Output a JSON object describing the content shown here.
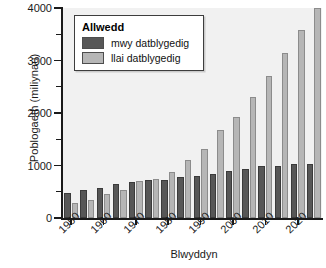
{
  "chart_data": {
    "type": "bar",
    "title": "",
    "xlabel": "Blwyddyn",
    "ylabel": "Poblogaeth (miliynau)",
    "ylim": [
      0,
      4000
    ],
    "yticks": [
      0,
      1000,
      2000,
      3000,
      4000
    ],
    "ytick_labels": [
      "0",
      "1000",
      "2000",
      "3000",
      "4000"
    ],
    "yticks_minor": [
      500,
      1500,
      2500,
      3500
    ],
    "grid": false,
    "legend": {
      "title": "Allwedd",
      "position": "upper-left-inside",
      "entries": [
        {
          "label": "mwy datblygedig",
          "color": "#575757"
        },
        {
          "label": "llai datblygedig",
          "color": "#b6b6b6"
        }
      ]
    },
    "x": [
      1950,
      1955,
      1960,
      1965,
      1970,
      1975,
      1980,
      1985,
      1990,
      1995,
      2000,
      2005,
      2010,
      2015,
      2020,
      2025
    ],
    "xtick_labels": [
      "1950",
      "1960",
      "1970",
      "1980",
      "1990",
      "2000",
      "2010",
      "2020"
    ],
    "xtick_values": [
      1950,
      1960,
      1970,
      1980,
      1990,
      2000,
      2010,
      2020
    ],
    "series": [
      {
        "name": "mwy datblygedig",
        "color": "#575757",
        "values": [
          470,
          540,
          580,
          640,
          680,
          720,
          730,
          775,
          800,
          845,
          890,
          925,
          985,
          1000,
          1030,
          1030
        ]
      },
      {
        "name": "llai datblygedig",
        "color": "#b6b6b6",
        "values": [
          280,
          335,
          450,
          530,
          700,
          750,
          870,
          1100,
          1320,
          1680,
          1930,
          2310,
          2710,
          3150,
          3580,
          4000
        ]
      }
    ]
  }
}
